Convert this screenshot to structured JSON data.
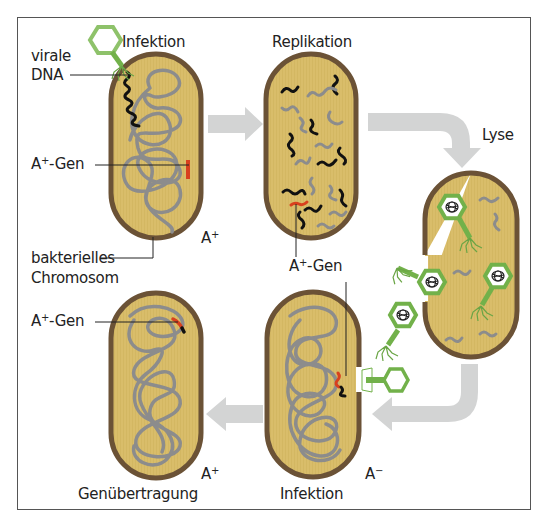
{
  "diagram": {
    "type": "transduction-cycle",
    "colors": {
      "frame": "#555555",
      "cell_fill": "#d9bd6a",
      "cell_border": "#6b5236",
      "chromosome": "#8c8c8c",
      "viral_dna": "#111111",
      "gene": "#d8401e",
      "phage": "#72b14a",
      "arrow": "#d3d4d4"
    },
    "stages": [
      {
        "id": "infection-1",
        "title": "Infektion",
        "genotype": "A",
        "genotype_sign": "+"
      },
      {
        "id": "replication",
        "title": "Replikation"
      },
      {
        "id": "lysis",
        "title": "Lyse"
      },
      {
        "id": "infection-2",
        "title": "Infektion",
        "genotype": "A",
        "genotype_sign": "−"
      },
      {
        "id": "gene-transfer",
        "title": "Genübertragung",
        "genotype": "A",
        "genotype_sign": "+"
      }
    ],
    "labels": {
      "viral_dna_line1": "virale",
      "viral_dna_line2": "DNA",
      "gene_prefix": "A",
      "gene_sup": "+",
      "gene_suffix": "-Gen",
      "chromosome_line1": "bakterielles",
      "chromosome_line2": "Chromosom"
    },
    "flow": [
      "infection-1",
      "replication",
      "lysis",
      "infection-2",
      "gene-transfer"
    ]
  }
}
